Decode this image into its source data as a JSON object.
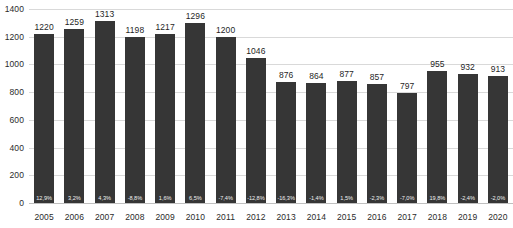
{
  "chart_data": {
    "type": "bar",
    "title": "",
    "subtitle": "",
    "xlabel": "",
    "ylabel": "",
    "ylim": [
      0,
      1400
    ],
    "grid": true,
    "legend": "none",
    "y_ticks": [
      "0",
      "200",
      "400",
      "600",
      "800",
      "1000",
      "1200",
      "1400"
    ],
    "y_tick_values": [
      0,
      200,
      400,
      600,
      800,
      1000,
      1200,
      1400
    ],
    "categories": [
      "2005",
      "2006",
      "2007",
      "2008",
      "2009",
      "2010",
      "2011",
      "2012",
      "2013",
      "2014",
      "2015",
      "2016",
      "2017",
      "2018",
      "2019",
      "2020"
    ],
    "values": [
      1220,
      1259,
      1313,
      1198,
      1217,
      1296,
      1200,
      1046,
      876,
      864,
      877,
      857,
      797,
      955,
      932,
      913
    ],
    "value_labels": [
      "1220",
      "1259",
      "1313",
      "1198",
      "1217",
      "1296",
      "1200",
      "1046",
      "876",
      "864",
      "877",
      "857",
      "797",
      "955",
      "932",
      "913"
    ],
    "series": [
      {
        "name": "value",
        "values": [
          1220,
          1259,
          1313,
          1198,
          1217,
          1296,
          1200,
          1046,
          876,
          864,
          877,
          857,
          797,
          955,
          932,
          913
        ]
      },
      {
        "name": "yoy_change_percent",
        "values": [
          12.9,
          3.2,
          4.3,
          -8.8,
          1.6,
          6.5,
          -7.4,
          -12.8,
          -16.3,
          -1.4,
          1.5,
          -2.3,
          -7.0,
          19.8,
          -2.4,
          -2.0
        ]
      }
    ],
    "inside_labels": [
      "12,9%",
      "3,2%",
      "4,3%",
      "-8,8%",
      "1,6%",
      "6,5%",
      "-7,4%",
      "-12,8%",
      "-16,3%",
      "-1,4%",
      "1,5%",
      "-2,3%",
      "-7,0%",
      "19,8%",
      "-2,4%",
      "-2,0%"
    ],
    "colors": {
      "bar": "#363636",
      "background": "#ffffff",
      "gridline": "#d9d9d9",
      "baseline": "#bfbfbf",
      "value_label": "#1f1f1f",
      "inside_label": "#f2f2f2",
      "tick_label": "#2b2b2b"
    }
  }
}
